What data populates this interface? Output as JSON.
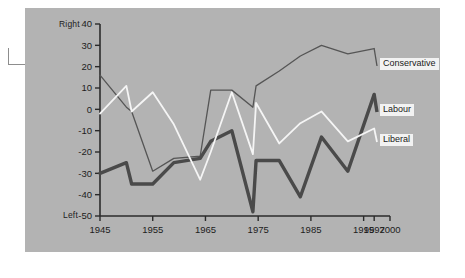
{
  "figure": {
    "background_color": "#b3b3b3",
    "page_color": "#ffffff",
    "axis_color": "#2b2b2b"
  },
  "axis_titles": {
    "top_pole": "Right",
    "bottom_pole": "Left"
  },
  "legend": [
    {
      "label": "Conservative",
      "color": "#555555",
      "style": "thin-dark"
    },
    {
      "label": "Labour",
      "color": "#4a4a4a",
      "style": "thick-dark"
    },
    {
      "label": "Liberal",
      "color": "#f5f5f5",
      "style": "white"
    }
  ],
  "chart_data": {
    "type": "line",
    "title": "",
    "xlabel": "",
    "ylabel": "",
    "xlim": [
      1945,
      2000
    ],
    "ylim": [
      -50,
      40
    ],
    "grid": false,
    "legend_position": "right-inline-labels",
    "xticks": [
      1945,
      1955,
      1965,
      1975,
      1985,
      1995,
      1997,
      2000
    ],
    "xtick_labels": [
      "1945",
      "1955",
      "1965",
      "1975",
      "1985",
      "1995",
      "1997",
      "2000"
    ],
    "yticks": [
      40,
      30,
      20,
      10,
      0,
      -10,
      -20,
      -30,
      -40,
      -50
    ],
    "ytick_labels": [
      "40",
      "30",
      "20",
      "10",
      "0",
      "-10",
      "-20",
      "-30",
      "-40",
      "-50"
    ],
    "series": [
      {
        "name": "Conservative",
        "color": "#555555",
        "width": 1.3,
        "x": [
          1945,
          1950,
          1951,
          1955,
          1959,
          1964,
          1966,
          1970,
          1974,
          1974.6,
          1979,
          1983,
          1987,
          1992,
          1997
        ],
        "values": [
          16,
          1,
          -1,
          -29,
          -23,
          -22,
          9,
          9,
          1,
          11,
          18,
          25,
          30,
          26,
          28.5
        ]
      },
      {
        "name": "Labour",
        "color": "#4a4a4a",
        "width": 3.4,
        "x": [
          1945,
          1950,
          1951,
          1955,
          1959,
          1964,
          1966,
          1970,
          1974,
          1974.6,
          1979,
          1983,
          1987,
          1992,
          1997
        ],
        "values": [
          -30,
          -25,
          -35,
          -35,
          -25,
          -23,
          -15,
          -10,
          -48,
          -24,
          -24,
          -41,
          -13,
          -29,
          7
        ]
      },
      {
        "name": "Liberal",
        "color": "#f5f5f5",
        "width": 1.8,
        "x": [
          1945,
          1950,
          1951,
          1955,
          1959,
          1964,
          1966,
          1970,
          1974,
          1974.6,
          1979,
          1983,
          1987,
          1992,
          1997
        ],
        "values": [
          -2,
          11,
          -1,
          8,
          -7,
          -33,
          -20,
          8,
          -21,
          3,
          -16,
          -6.5,
          -1,
          -15,
          -9
        ]
      }
    ]
  }
}
